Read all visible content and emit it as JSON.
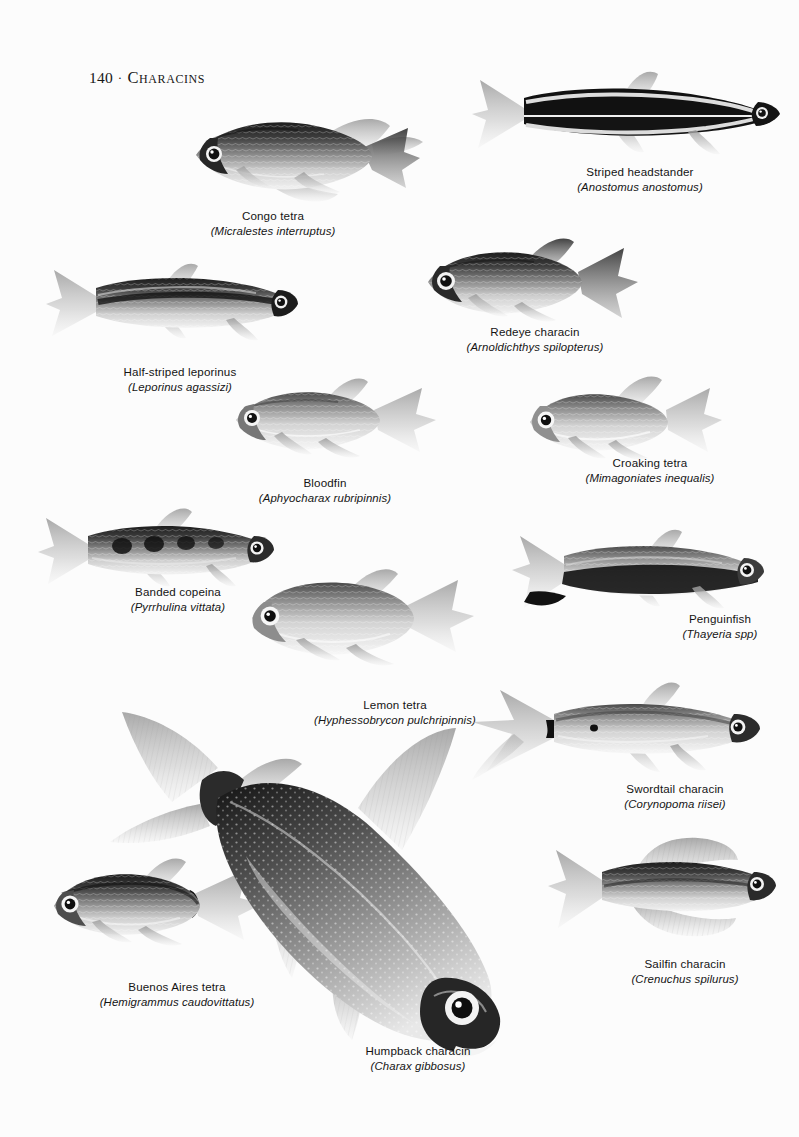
{
  "page": {
    "folio": "140",
    "separator": "·",
    "section_title": "Characins",
    "background_color": "#fcfcfc",
    "ink_color": "#141414",
    "plate_type": "grayscale fish illustration plate"
  },
  "figures": [
    {
      "id": "congo-tetra",
      "common_name": "Congo tetra",
      "scientific_name": "(Micralestes interruptus)",
      "orientation": "head-left",
      "body_shape": "deep-bodied tetra with long trailing dorsal and forked tail"
    },
    {
      "id": "striped-headstander",
      "common_name": "Striped headstander",
      "scientific_name": "(Anostomus anostomus)",
      "orientation": "head-right",
      "body_shape": "elongated torpedo body with bold horizontal black and cream stripes"
    },
    {
      "id": "redeye-characin",
      "common_name": "Redeye characin",
      "scientific_name": "(Arnoldichthys spilopterus)",
      "orientation": "head-left",
      "body_shape": "stocky scaled body, large eye, dark forked tail"
    },
    {
      "id": "half-striped-leporinus",
      "common_name": "Half-striped leporinus",
      "scientific_name": "(Leporinus agassizi)",
      "orientation": "head-right",
      "body_shape": "slender cylindrical body with dark lateral band"
    },
    {
      "id": "bloodfin",
      "common_name": "Bloodfin",
      "scientific_name": "(Aphyocharax rubripinnis)",
      "orientation": "head-left",
      "body_shape": "streamlined silver tetra with pointed fins"
    },
    {
      "id": "croaking-tetra",
      "common_name": "Croaking tetra",
      "scientific_name": "(Mimagoniates inequalis)",
      "orientation": "head-left",
      "body_shape": "pale deep-bellied tetra with tall dorsal fin"
    },
    {
      "id": "banded-copeina",
      "common_name": "Banded copeina",
      "scientific_name": "(Pyrrhulina vittata)",
      "orientation": "head-right",
      "body_shape": "pencil-shaped body with dark blotches along the flank"
    },
    {
      "id": "penguinfish",
      "common_name": "Penguinfish",
      "scientific_name": "(Thayeria spp)",
      "orientation": "head-right",
      "body_shape": "slender body with black band running into the lower tail lobe"
    },
    {
      "id": "lemon-tetra",
      "common_name": "Lemon tetra",
      "scientific_name": "(Hyphessobrycon pulchripinnis)",
      "orientation": "head-left",
      "body_shape": "tall, laterally compressed pale tetra"
    },
    {
      "id": "swordtail-characin",
      "common_name": "Swordtail characin",
      "scientific_name": "(Corynopoma riisei)",
      "orientation": "head-right",
      "body_shape": "slim body with long filamentous tail and fin extensions"
    },
    {
      "id": "buenos-aires-tetra",
      "common_name": "Buenos Aires tetra",
      "scientific_name": "(Hemigrammus caudovittatus)",
      "orientation": "head-left",
      "body_shape": "silvery tetra with black wedge at the caudal peduncle"
    },
    {
      "id": "sailfin-characin",
      "common_name": "Sailfin characin",
      "scientific_name": "(Crenuchus spilurus)",
      "orientation": "head-right",
      "body_shape": "small fish with broad sail-like dorsal and anal fins"
    },
    {
      "id": "humpback-characin",
      "common_name": "Humpback characin",
      "scientific_name": "(Charax gibbosus)",
      "orientation": "diagonal, head-down to lower right",
      "body_shape": "large arch-backed deep body, speckled flank, translucent fins"
    }
  ]
}
